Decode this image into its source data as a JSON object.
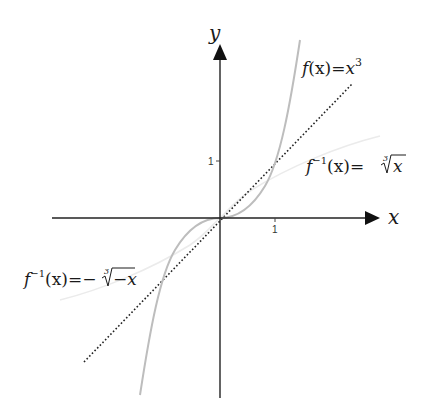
{
  "diagram": {
    "axes": {
      "x_label": "x",
      "y_label": "y",
      "x_tick_label": "1",
      "y_tick_label": "1"
    },
    "labels": {
      "cube": {
        "f": "f",
        "arg": "(x)",
        "eq": "=",
        "rhs": "x",
        "exp": "3"
      },
      "cbrt_pos": {
        "f": "f",
        "sup": "−1",
        "arg": "(x)",
        "eq": "=",
        "index": "3",
        "rad": "x"
      },
      "cbrt_neg": {
        "f": "f",
        "sup": "−1",
        "arg": "(x)",
        "eq": "=−",
        "index": "3",
        "rad": "−x"
      }
    },
    "colors": {
      "axis": "#222222",
      "cube_curve": "#bdbdbd",
      "inverse_curve": "#ececec",
      "identity_line": "#222222"
    }
  }
}
